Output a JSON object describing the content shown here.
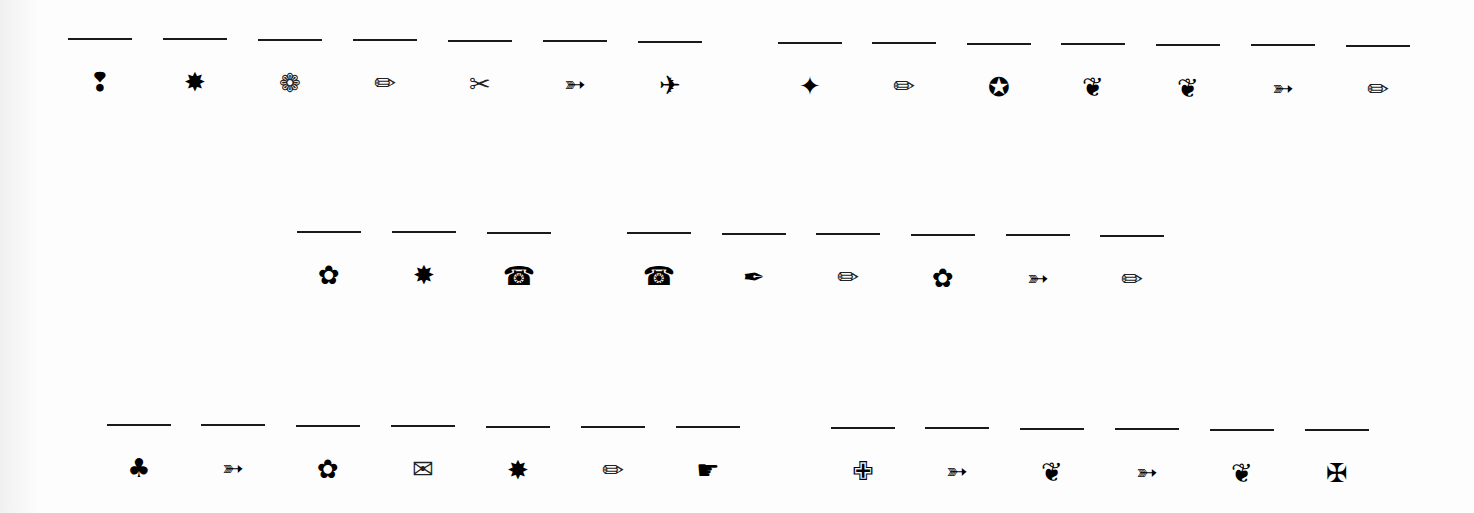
{
  "worksheet": {
    "rows": [
      {
        "groups": [
          [
            {
              "icon": "heavy-exclamation-drop-icon",
              "glyph": "❢"
            },
            {
              "icon": "starburst-icon",
              "glyph": "✸"
            },
            {
              "icon": "outlined-flower-icon",
              "glyph": "❁"
            },
            {
              "icon": "pencil-icon",
              "glyph": "✏"
            },
            {
              "icon": "scissors-icon",
              "glyph": "✂"
            },
            {
              "icon": "arrow-icon",
              "glyph": "➳"
            },
            {
              "icon": "airplane-icon",
              "glyph": "✈"
            }
          ],
          [
            {
              "icon": "four-point-star-icon",
              "glyph": "✦"
            },
            {
              "icon": "pencil-icon",
              "glyph": "✏"
            },
            {
              "icon": "hollow-center-star-icon",
              "glyph": "✪"
            },
            {
              "icon": "floral-heart-icon",
              "glyph": "❦"
            },
            {
              "icon": "floral-heart-icon",
              "glyph": "❦"
            },
            {
              "icon": "arrow-icon",
              "glyph": "➳"
            },
            {
              "icon": "pencil-icon",
              "glyph": "✏"
            }
          ]
        ]
      },
      {
        "groups": [
          [
            {
              "icon": "five-petal-flower-icon",
              "glyph": "✿"
            },
            {
              "icon": "starburst-icon",
              "glyph": "✸"
            },
            {
              "icon": "telephone-icon",
              "glyph": "☎"
            }
          ],
          [
            {
              "icon": "telephone-icon",
              "glyph": "☎"
            },
            {
              "icon": "pen-nib-icon",
              "glyph": "✒"
            },
            {
              "icon": "pencil-icon",
              "glyph": "✏"
            },
            {
              "icon": "five-petal-flower-icon",
              "glyph": "✿"
            },
            {
              "icon": "arrow-icon",
              "glyph": "➳"
            },
            {
              "icon": "pencil-icon",
              "glyph": "✏"
            }
          ]
        ]
      },
      {
        "groups": [
          [
            {
              "icon": "club-suit-icon",
              "glyph": "♣"
            },
            {
              "icon": "arrow-icon",
              "glyph": "➳"
            },
            {
              "icon": "five-petal-flower-icon",
              "glyph": "✿"
            },
            {
              "icon": "envelope-icon",
              "glyph": "✉"
            },
            {
              "icon": "starburst-icon",
              "glyph": "✸"
            },
            {
              "icon": "pencil-icon",
              "glyph": "✏"
            },
            {
              "icon": "pointing-hand-icon",
              "glyph": "☛"
            }
          ],
          [
            {
              "icon": "outlined-cross-icon",
              "glyph": "✙"
            },
            {
              "icon": "arrow-icon",
              "glyph": "➳"
            },
            {
              "icon": "floral-heart-icon",
              "glyph": "❦"
            },
            {
              "icon": "arrow-icon",
              "glyph": "➳"
            },
            {
              "icon": "floral-heart-icon",
              "glyph": "❦"
            },
            {
              "icon": "maltese-cross-icon",
              "glyph": "✠"
            }
          ]
        ]
      }
    ]
  },
  "r0_0": "❢",
  "r0_1": "✸",
  "r0_2": "❁",
  "r0_3": "✏",
  "r0_4": "✂",
  "r0_5": "➳",
  "r0_6": "✈",
  "r0_7": "✦",
  "r0_8": "✏",
  "r0_9": "✪",
  "r0_10": "❦",
  "r0_11": "❦",
  "r0_12": "➳",
  "r0_13": "✏",
  "r1_0": "✿",
  "r1_1": "✸",
  "r1_2": "☎",
  "r1_3": "☎",
  "r1_4": "✒",
  "r1_5": "✏",
  "r1_6": "✿",
  "r1_7": "➳",
  "r1_8": "✏",
  "r2_0": "♣",
  "r2_1": "➳",
  "r2_2": "✿",
  "r2_3": "✉",
  "r2_4": "✸",
  "r2_5": "✏",
  "r2_6": "☛",
  "r2_7": "✙",
  "r2_8": "➳",
  "r2_9": "❦",
  "r2_10": "➳",
  "r2_11": "❦",
  "r2_12": "✠"
}
